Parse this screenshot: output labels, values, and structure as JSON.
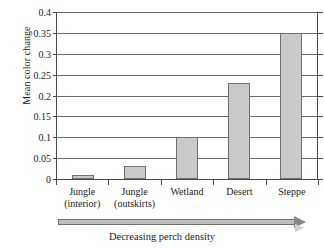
{
  "chart_data": {
    "type": "bar",
    "title": "",
    "xlabel": "Decreasing perch density",
    "ylabel": "Mean color change",
    "categories": [
      "Jungle (interior)",
      "Jungle (outskirts)",
      "Wetland",
      "Desert",
      "Steppe"
    ],
    "category_lines": [
      {
        "line1": "Jungle",
        "line2": "(interior)"
      },
      {
        "line1": "Jungle",
        "line2": "(outskirts)"
      },
      {
        "line1": "Wetland",
        "line2": ""
      },
      {
        "line1": "Desert",
        "line2": ""
      },
      {
        "line1": "Steppe",
        "line2": ""
      }
    ],
    "values": [
      0.01,
      0.03,
      0.1,
      0.23,
      0.35
    ],
    "ylim": [
      0,
      0.4
    ],
    "yticks": [
      0,
      0.05,
      0.1,
      0.15,
      0.2,
      0.25,
      0.3,
      0.35,
      0.4
    ],
    "ytick_labels": [
      "0",
      "0.05",
      "0.1",
      "0.15",
      "0.2",
      "0.25",
      "0.3",
      "0.35",
      "0.4"
    ],
    "grid": true,
    "legend": false,
    "bar_color": "#c9c9c9",
    "bar_border_color": "#707070",
    "axis_color": "#4a4a4a",
    "gridline_color": "#6b6b6b"
  },
  "annotation": {
    "arrow_caption": "Decreasing perch density",
    "arrow_direction": "right"
  }
}
